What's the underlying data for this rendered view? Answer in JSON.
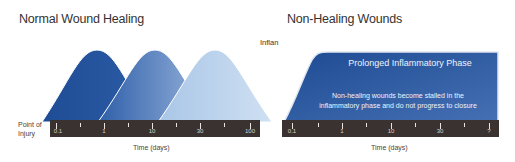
{
  "left": {
    "title": "Normal Wound Healing",
    "y_label_line1": "Point of",
    "y_label_line2": "Injury",
    "x_label": "Time (days)",
    "tick_labels": [
      "0.1",
      "1",
      "10",
      "30",
      "100"
    ],
    "phases": [
      {
        "name": "phase-1",
        "color_top": "#1f4f97",
        "color_bottom": "#2a5aa3"
      },
      {
        "name": "phase-2",
        "color_top": "#5b84c1",
        "color_bottom": "#2e5ea8"
      },
      {
        "name": "phase-3",
        "color_top": "#c6daf0",
        "color_bottom": "#a8c5e6"
      }
    ]
  },
  "right": {
    "title": "Non-Healing Wounds",
    "cut_label": "Inflan",
    "panel_title": "Prolonged Inflammatory Phase",
    "panel_desc_line1": "Non-healing wounds become stalled in the",
    "panel_desc_line2": "inflammatory phase and do not progress to closure",
    "x_label": "Time (days)",
    "tick_labels": [
      "0.1",
      "1",
      "10",
      "30",
      "?"
    ],
    "color_top": "#3f64a8",
    "color_bottom": "#1d4b93"
  },
  "axis_color": "#3a3231"
}
